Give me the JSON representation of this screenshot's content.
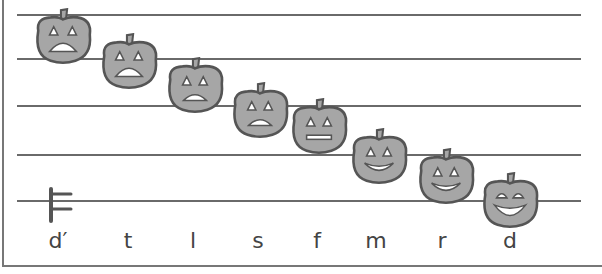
{
  "staff": {
    "line_count": 5,
    "line_y": [
      14,
      58,
      105,
      154,
      200
    ]
  },
  "clef": {
    "type": "do-clef",
    "icon": "do-clef-icon"
  },
  "colors": {
    "pumpkin_fill": "#a6a6a6",
    "pumpkin_stroke": "#555555",
    "line": "#6a6a6a"
  },
  "notes": [
    {
      "label": "d′",
      "expression": "scared",
      "x": 30,
      "y": 8
    },
    {
      "label": "t",
      "expression": "scared",
      "x": 96,
      "y": 33
    },
    {
      "label": "l",
      "expression": "worried",
      "x": 162,
      "y": 57
    },
    {
      "label": "s",
      "expression": "worried",
      "x": 227,
      "y": 82
    },
    {
      "label": "f",
      "expression": "neutral",
      "x": 286,
      "y": 98
    },
    {
      "label": "m",
      "expression": "smiling",
      "x": 346,
      "y": 128
    },
    {
      "label": "r",
      "expression": "smiling",
      "x": 413,
      "y": 148
    },
    {
      "label": "d",
      "expression": "laughing",
      "x": 477,
      "y": 172
    }
  ],
  "label_x": [
    58,
    128,
    193,
    258,
    317,
    376,
    442,
    510
  ]
}
